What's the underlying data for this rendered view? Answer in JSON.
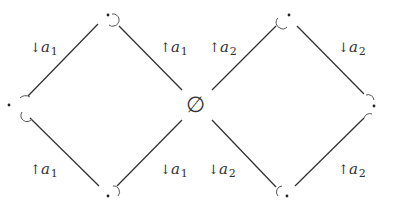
{
  "diagram": {
    "type": "lattice",
    "center_node": {
      "label": "∅",
      "x": 197,
      "y": 105
    },
    "nodes": [
      {
        "id": "top-left",
        "label": "·",
        "x": 108,
        "y": 17
      },
      {
        "id": "left",
        "label": "·",
        "x": 10,
        "y": 105
      },
      {
        "id": "bottom-left",
        "label": "·",
        "x": 108,
        "y": 192
      },
      {
        "id": "top-right",
        "label": "·",
        "x": 287,
        "y": 17
      },
      {
        "id": "right",
        "label": "·",
        "x": 386,
        "y": 105
      },
      {
        "id": "bottom-right",
        "label": "·",
        "x": 287,
        "y": 192
      }
    ],
    "edge_labels": [
      {
        "id": "tl-left",
        "arrow": "↓",
        "var": "a",
        "sub": "1"
      },
      {
        "id": "tl-center",
        "arrow": "↑",
        "var": "a",
        "sub": "1"
      },
      {
        "id": "left-bl",
        "arrow": "↑",
        "var": "a",
        "sub": "1"
      },
      {
        "id": "bl-center",
        "arrow": "↓",
        "var": "a",
        "sub": "1"
      },
      {
        "id": "center-tr",
        "arrow": "↑",
        "var": "a",
        "sub": "2"
      },
      {
        "id": "tr-right",
        "arrow": "↓",
        "var": "a",
        "sub": "2"
      },
      {
        "id": "center-br",
        "arrow": "↓",
        "var": "a",
        "sub": "2"
      },
      {
        "id": "br-right",
        "arrow": "↑",
        "var": "a",
        "sub": "2"
      }
    ]
  }
}
